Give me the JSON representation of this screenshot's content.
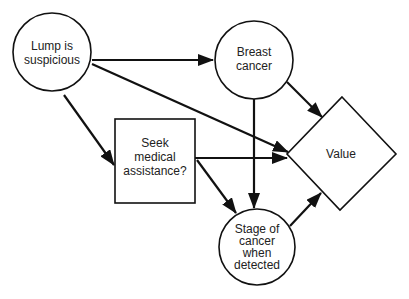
{
  "diagram": {
    "type": "influence-diagram",
    "nodes": [
      {
        "id": "lump",
        "shape": "circle",
        "lines": [
          "Lump is",
          "suspicious"
        ]
      },
      {
        "id": "breast",
        "shape": "circle",
        "lines": [
          "Breast",
          "cancer"
        ]
      },
      {
        "id": "seek",
        "shape": "rectangle",
        "lines": [
          "Seek",
          "medical",
          "assistance?"
        ]
      },
      {
        "id": "value",
        "shape": "diamond",
        "lines": [
          "Value"
        ]
      },
      {
        "id": "stage",
        "shape": "circle",
        "lines": [
          "Stage of",
          "cancer",
          "when",
          "detected"
        ]
      }
    ],
    "edges": [
      {
        "from": "lump",
        "to": "breast"
      },
      {
        "from": "lump",
        "to": "seek"
      },
      {
        "from": "lump",
        "to": "value"
      },
      {
        "from": "breast",
        "to": "value"
      },
      {
        "from": "breast",
        "to": "stage"
      },
      {
        "from": "seek",
        "to": "value"
      },
      {
        "from": "seek",
        "to": "stage"
      },
      {
        "from": "stage",
        "to": "value"
      }
    ],
    "colors": {
      "stroke": "#111111",
      "background": "#ffffff",
      "text": "#222222"
    }
  }
}
